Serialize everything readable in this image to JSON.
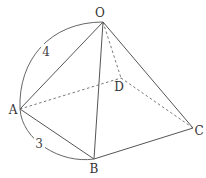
{
  "figure": {
    "vertices": {
      "O": {
        "label": "O",
        "x": 103,
        "y": 22
      },
      "A": {
        "label": "A",
        "x": 20,
        "y": 109
      },
      "B": {
        "label": "B",
        "x": 94,
        "y": 159
      },
      "C": {
        "label": "C",
        "x": 193,
        "y": 128
      },
      "D": {
        "label": "D",
        "x": 121,
        "y": 78
      }
    },
    "edges_visible": [
      "OA",
      "OB",
      "OC",
      "AB",
      "BC"
    ],
    "edges_hidden": [
      "OD",
      "AD",
      "DC"
    ],
    "measurements": {
      "OA": {
        "label": "4"
      },
      "AB": {
        "label": "3"
      }
    }
  }
}
